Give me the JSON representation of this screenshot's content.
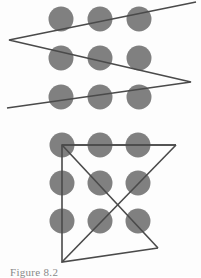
{
  "page": {
    "background_color": "#fdfdfd",
    "width": 201,
    "height": 277
  },
  "caption": {
    "text": "Figure 8.2",
    "color": "#5a5a5a",
    "note": "clipped at bottom edge of image"
  },
  "style": {
    "dot_color": "#808080",
    "line_color": "#4a4a4a",
    "line_width": 1.6,
    "dot_radius": 12.5
  },
  "figures": [
    {
      "id": "top-figure",
      "name": "nine-dot-grid-zigzag",
      "description": "Three-by-three grid of gray dots crossed by a single continuous zigzag polyline",
      "dots": [
        {
          "cx": 61,
          "cy": 19
        },
        {
          "cx": 100,
          "cy": 19
        },
        {
          "cx": 139,
          "cy": 19
        },
        {
          "cx": 61,
          "cy": 58
        },
        {
          "cx": 100,
          "cy": 58
        },
        {
          "cx": 139,
          "cy": 58
        },
        {
          "cx": 61,
          "cy": 97
        },
        {
          "cx": 100,
          "cy": 97
        },
        {
          "cx": 139,
          "cy": 97
        }
      ],
      "polyline": [
        {
          "x": 196,
          "y": 2
        },
        {
          "x": 9,
          "y": 40
        },
        {
          "x": 191,
          "y": 82
        },
        {
          "x": 7,
          "y": 108
        }
      ]
    },
    {
      "id": "bottom-figure",
      "name": "nine-dot-grid-four-line-solution",
      "description": "Three-by-three grid of gray dots with the classic four-line solution extending outside the grid",
      "dots": [
        {
          "cx": 62,
          "cy": 145
        },
        {
          "cx": 100,
          "cy": 145
        },
        {
          "cx": 138,
          "cy": 145
        },
        {
          "cx": 62,
          "cy": 183
        },
        {
          "cx": 100,
          "cy": 183
        },
        {
          "cx": 138,
          "cy": 183
        },
        {
          "cx": 62,
          "cy": 221
        },
        {
          "cx": 100,
          "cy": 221
        },
        {
          "cx": 138,
          "cy": 221
        }
      ],
      "polyline": [
        {
          "x": 176,
          "y": 145
        },
        {
          "x": 62,
          "y": 145
        },
        {
          "x": 62,
          "y": 262
        },
        {
          "x": 158,
          "y": 248
        }
      ],
      "extra_segments": [
        {
          "x1": 62,
          "y1": 145,
          "x2": 176,
          "y2": 145
        },
        {
          "x1": 176,
          "y1": 145,
          "x2": 62,
          "y2": 262
        },
        {
          "x1": 62,
          "y1": 145,
          "x2": 158,
          "y2": 248
        }
      ]
    }
  ]
}
